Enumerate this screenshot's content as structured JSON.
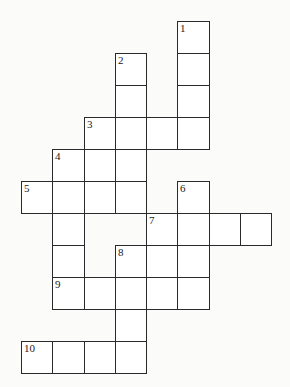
{
  "puzzle": {
    "type": "crossword",
    "cell_size": {
      "w": 31.25,
      "h": 32
    },
    "origin": {
      "x": 21,
      "y": 21
    },
    "cells": [
      {
        "r": 0,
        "c": 5,
        "num": "1"
      },
      {
        "r": 1,
        "c": 3,
        "num": "2"
      },
      {
        "r": 1,
        "c": 5,
        "num": ""
      },
      {
        "r": 2,
        "c": 3,
        "num": ""
      },
      {
        "r": 2,
        "c": 5,
        "num": ""
      },
      {
        "r": 3,
        "c": 2,
        "num": "3"
      },
      {
        "r": 3,
        "c": 3,
        "num": ""
      },
      {
        "r": 3,
        "c": 4,
        "num": ""
      },
      {
        "r": 3,
        "c": 5,
        "num": ""
      },
      {
        "r": 4,
        "c": 1,
        "num": "4"
      },
      {
        "r": 4,
        "c": 2,
        "num": ""
      },
      {
        "r": 4,
        "c": 3,
        "num": ""
      },
      {
        "r": 5,
        "c": 0,
        "num": "5"
      },
      {
        "r": 5,
        "c": 1,
        "num": ""
      },
      {
        "r": 5,
        "c": 2,
        "num": ""
      },
      {
        "r": 5,
        "c": 3,
        "num": ""
      },
      {
        "r": 5,
        "c": 5,
        "num": "6"
      },
      {
        "r": 6,
        "c": 1,
        "num": ""
      },
      {
        "r": 6,
        "c": 4,
        "num": "7"
      },
      {
        "r": 6,
        "c": 5,
        "num": ""
      },
      {
        "r": 6,
        "c": 6,
        "num": ""
      },
      {
        "r": 6,
        "c": 7,
        "num": ""
      },
      {
        "r": 7,
        "c": 1,
        "num": ""
      },
      {
        "r": 7,
        "c": 3,
        "num": "8"
      },
      {
        "r": 7,
        "c": 4,
        "num": ""
      },
      {
        "r": 7,
        "c": 5,
        "num": ""
      },
      {
        "r": 8,
        "c": 1,
        "num": "9"
      },
      {
        "r": 8,
        "c": 2,
        "num": ""
      },
      {
        "r": 8,
        "c": 3,
        "num": ""
      },
      {
        "r": 8,
        "c": 4,
        "num": ""
      },
      {
        "r": 8,
        "c": 5,
        "num": ""
      },
      {
        "r": 9,
        "c": 3,
        "num": ""
      },
      {
        "r": 10,
        "c": 0,
        "num": "10"
      },
      {
        "r": 10,
        "c": 1,
        "num": ""
      },
      {
        "r": 10,
        "c": 2,
        "num": ""
      },
      {
        "r": 10,
        "c": 3,
        "num": ""
      }
    ]
  }
}
